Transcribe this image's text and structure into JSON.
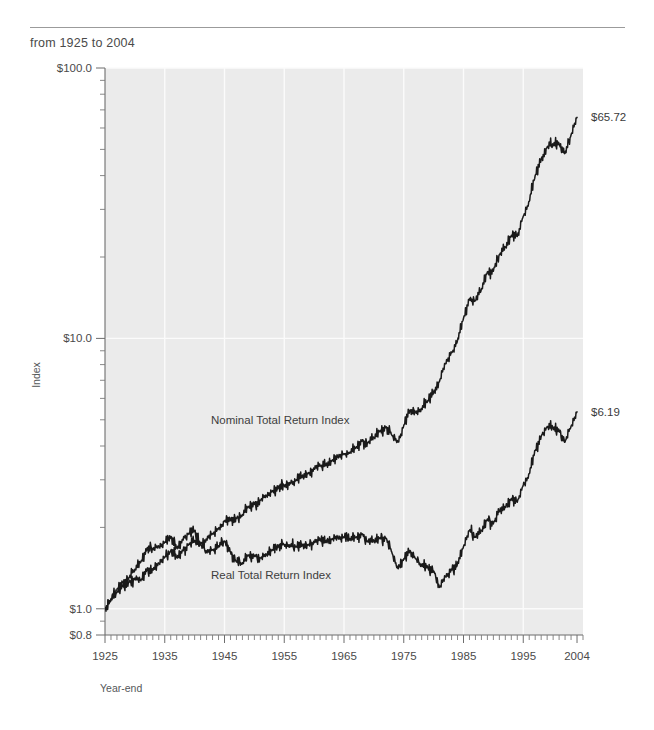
{
  "header": {
    "subtitle": "from 1925 to 2004"
  },
  "chart_data": {
    "type": "line",
    "title": "",
    "subtitle": "from 1925 to 2004",
    "xlabel": "Year-end",
    "ylabel": "Index",
    "yscale": "log",
    "ylim": [
      0.8,
      100.0
    ],
    "xlim": [
      1925,
      2005
    ],
    "grid": true,
    "legend": "inline-annotations",
    "ytick_labels": [
      "$100.0",
      "$10.0",
      "$1.0",
      "$0.8"
    ],
    "ytick_values": [
      100.0,
      10.0,
      1.0,
      0.8
    ],
    "xtick_labels": [
      "1925",
      "1935",
      "1945",
      "1955",
      "1965",
      "1975",
      "1985",
      "1995",
      "2004"
    ],
    "xtick_values": [
      1925,
      1935,
      1945,
      1955,
      1965,
      1975,
      1985,
      1995,
      2004
    ],
    "annotations": [
      {
        "name": "nominal-end-value",
        "text": "$65.72",
        "value": 65.72,
        "at_x": 2004
      },
      {
        "name": "real-end-value",
        "text": "$6.19",
        "value": 6.19,
        "at_x": 2004
      }
    ],
    "series": [
      {
        "name": "Nominal Total Return Index",
        "label": "Nominal Total Return Index",
        "color": "#1a1a1a",
        "x": [
          1925,
          1926,
          1927,
          1928,
          1929,
          1930,
          1931,
          1932,
          1933,
          1934,
          1935,
          1936,
          1937,
          1938,
          1939,
          1940,
          1941,
          1942,
          1943,
          1944,
          1945,
          1946,
          1947,
          1948,
          1949,
          1950,
          1951,
          1952,
          1953,
          1954,
          1955,
          1956,
          1957,
          1958,
          1959,
          1960,
          1961,
          1962,
          1963,
          1964,
          1965,
          1966,
          1967,
          1968,
          1969,
          1970,
          1971,
          1972,
          1973,
          1974,
          1975,
          1976,
          1977,
          1978,
          1979,
          1980,
          1981,
          1982,
          1983,
          1984,
          1985,
          1986,
          1987,
          1988,
          1989,
          1990,
          1991,
          1992,
          1993,
          1994,
          1995,
          1996,
          1997,
          1998,
          1999,
          2000,
          2001,
          2002,
          2003,
          2004
        ],
        "values": [
          1.0,
          1.08,
          1.15,
          1.21,
          1.25,
          1.3,
          1.27,
          1.39,
          1.4,
          1.47,
          1.55,
          1.64,
          1.55,
          1.64,
          1.73,
          1.78,
          1.74,
          1.8,
          1.89,
          1.99,
          2.11,
          2.13,
          2.16,
          2.23,
          2.38,
          2.43,
          2.52,
          2.62,
          2.72,
          2.8,
          2.86,
          2.91,
          2.99,
          3.09,
          3.16,
          3.3,
          3.38,
          3.42,
          3.53,
          3.64,
          3.74,
          3.8,
          3.94,
          4.16,
          4.11,
          4.3,
          4.55,
          4.67,
          4.39,
          4.14,
          4.76,
          5.4,
          5.36,
          5.47,
          5.87,
          6.34,
          6.95,
          8.09,
          8.84,
          9.83,
          11.87,
          14.02,
          13.77,
          15.24,
          17.62,
          17.73,
          20.43,
          21.8,
          24.05,
          23.8,
          28.32,
          32.13,
          40.06,
          45.97,
          51.04,
          52.2,
          52.34,
          48.39,
          56.53,
          65.72
        ],
        "values_note": "log-scale index, $1 invested at year-end 1925"
      },
      {
        "name": "Real Total Return Index",
        "label": "Real Total Return Index",
        "color": "#1a1a1a",
        "x": [
          1925,
          1926,
          1927,
          1928,
          1929,
          1930,
          1931,
          1932,
          1933,
          1934,
          1935,
          1936,
          1937,
          1938,
          1939,
          1940,
          1941,
          1942,
          1943,
          1944,
          1945,
          1946,
          1947,
          1948,
          1949,
          1950,
          1951,
          1952,
          1953,
          1954,
          1955,
          1956,
          1957,
          1958,
          1959,
          1960,
          1961,
          1962,
          1963,
          1964,
          1965,
          1966,
          1967,
          1968,
          1969,
          1970,
          1971,
          1972,
          1973,
          1974,
          1975,
          1976,
          1977,
          1978,
          1979,
          1980,
          1981,
          1982,
          1983,
          1984,
          1985,
          1986,
          1987,
          1988,
          1989,
          1990,
          1991,
          1992,
          1993,
          1994,
          1995,
          1996,
          1997,
          1998,
          1999,
          2000,
          2001,
          2002,
          2003,
          2004
        ],
        "values": [
          1.0,
          1.09,
          1.18,
          1.25,
          1.3,
          1.4,
          1.49,
          1.66,
          1.67,
          1.7,
          1.76,
          1.84,
          1.68,
          1.8,
          1.9,
          1.95,
          1.72,
          1.62,
          1.65,
          1.71,
          1.78,
          1.62,
          1.49,
          1.48,
          1.58,
          1.56,
          1.54,
          1.59,
          1.65,
          1.7,
          1.73,
          1.71,
          1.7,
          1.72,
          1.72,
          1.77,
          1.8,
          1.78,
          1.81,
          1.83,
          1.84,
          1.82,
          1.84,
          1.88,
          1.77,
          1.79,
          1.83,
          1.82,
          1.62,
          1.41,
          1.53,
          1.64,
          1.53,
          1.45,
          1.42,
          1.38,
          1.2,
          1.32,
          1.39,
          1.47,
          1.7,
          1.95,
          1.84,
          1.95,
          2.15,
          2.06,
          2.3,
          2.38,
          2.56,
          2.48,
          2.87,
          3.16,
          3.85,
          4.34,
          4.72,
          4.67,
          4.55,
          4.14,
          4.73,
          5.35
        ],
        "values_note": "inflation-adjusted index, $1 invested at year-end 1925; trough ~0.82 in 1982"
      }
    ]
  }
}
